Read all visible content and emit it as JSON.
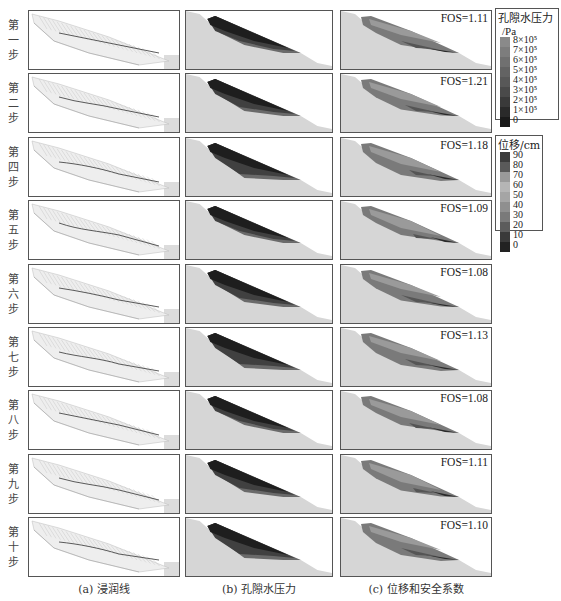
{
  "figure": {
    "rows": [
      {
        "label": "第一步",
        "fos": "FOS=1.11",
        "variant": 0
      },
      {
        "label": "第二步",
        "fos": "FOS=1.21",
        "variant": 1
      },
      {
        "label": "第四步",
        "fos": "FOS=1.18",
        "variant": 2
      },
      {
        "label": "第五步",
        "fos": "FOS=1.09",
        "variant": 3
      },
      {
        "label": "第六步",
        "fos": "FOS=1.08",
        "variant": 4
      },
      {
        "label": "第七步",
        "fos": "FOS=1.13",
        "variant": 5
      },
      {
        "label": "第八步",
        "fos": "FOS=1.08",
        "variant": 6
      },
      {
        "label": "第九步",
        "fos": "FOS=1.11",
        "variant": 7
      },
      {
        "label": "第十步",
        "fos": "FOS=1.10",
        "variant": 8
      }
    ],
    "captions": {
      "a": "(a) 浸润线",
      "b": "(b) 孔隙水压力",
      "c": "(c) 位移和安全系数"
    },
    "legend_pressure": {
      "title": "孔隙水压力",
      "unit": "/Pa",
      "ticks": [
        "8×10⁵",
        "7×10⁵",
        "6×10⁵",
        "5×10⁵",
        "4×10⁵",
        "3×10⁵",
        "2×10⁵",
        "1×10⁵",
        "0"
      ],
      "colors": [
        "#8a8a8a",
        "#7d7d7d",
        "#707070",
        "#636363",
        "#585858",
        "#4a4a4a",
        "#3a3a3a",
        "#2a2a2a",
        "#1a1a1a"
      ]
    },
    "legend_displacement": {
      "title": "位移/cm",
      "ticks": [
        "90",
        "80",
        "70",
        "60",
        "50",
        "40",
        "30",
        "20",
        "10",
        "0"
      ],
      "colors": [
        "#3c3c3c",
        "#5a5a5a",
        "#9a9a9a",
        "#b5b5b5",
        "#a5a5a5",
        "#8f8f8f",
        "#7a7a7a",
        "#5c5c5c",
        "#3a3a3a",
        "#222222"
      ]
    },
    "colors": {
      "panel_border": "#555555",
      "ground": "#d6d6d6",
      "pressure_dark": "#1e1e1e",
      "pressure_mid": "#555555",
      "displacement_mid": "#7a7a7a",
      "mesh_line": "#c8c8c8",
      "seepage_line": "#333333"
    }
  }
}
